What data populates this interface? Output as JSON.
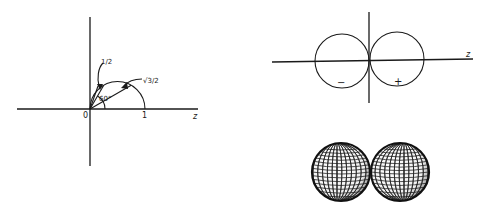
{
  "figure": {
    "left_panel": {
      "description": "Circle of diameter 1 on the z axis showing chord lengths cos(theta)",
      "origin_label": "0",
      "unit_label": "1",
      "axis_label": "z",
      "angle_label": "60°",
      "chord_labels": [
        "1/2",
        "√3/2"
      ],
      "chord_angles_deg_from_z": [
        60,
        30
      ],
      "chord_lengths": [
        0.5,
        0.866
      ]
    },
    "right_top_panel": {
      "description": "Polar plot of cos(theta): two tangent circles",
      "axis_label": "z",
      "lobe_signs": [
        "−",
        "+"
      ]
    },
    "right_bottom_panel": {
      "description": "3D wireframe surface of p-orbital dumbbell",
      "lobe_count": 2
    },
    "colors": {
      "ink": "#1a1a1a",
      "background": "#ffffff"
    }
  }
}
